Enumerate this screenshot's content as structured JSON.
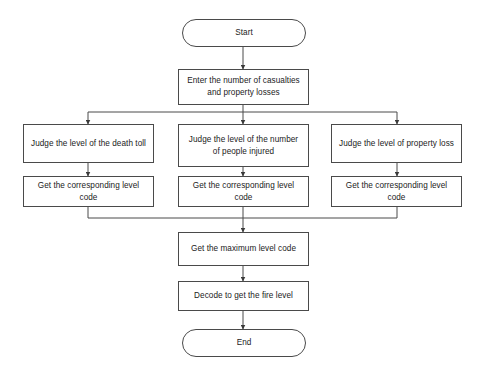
{
  "diagram": {
    "background_color": "#ffffff",
    "line_color": "#4a4a4a",
    "text_color": "#1b1b1b"
  },
  "nodes": {
    "start": {
      "label": "Start",
      "shape": "terminal"
    },
    "input": {
      "label": "Enter the number of casualties and property losses",
      "shape": "process"
    },
    "judge_death": {
      "label": "Judge the level of the death toll",
      "shape": "process"
    },
    "judge_injured": {
      "label": "Judge the level of the number of people injured",
      "shape": "process"
    },
    "judge_property": {
      "label": "Judge the level of property loss",
      "shape": "process"
    },
    "code_death": {
      "label": "Get the corresponding level code",
      "shape": "process"
    },
    "code_injured": {
      "label": "Get the corresponding level code",
      "shape": "process"
    },
    "code_property": {
      "label": "Get the corresponding level code",
      "shape": "process"
    },
    "max_code": {
      "label": "Get the maximum level code",
      "shape": "process"
    },
    "decode": {
      "label": "Decode to get the fire level",
      "shape": "process"
    },
    "end": {
      "label": "End",
      "shape": "terminal"
    }
  },
  "edges": [
    {
      "from": "start",
      "to": "input",
      "type": "straight"
    },
    {
      "from": "input",
      "to": "judge_death",
      "type": "split-left"
    },
    {
      "from": "input",
      "to": "judge_injured",
      "type": "straight"
    },
    {
      "from": "input",
      "to": "judge_property",
      "type": "split-right"
    },
    {
      "from": "judge_death",
      "to": "code_death",
      "type": "straight"
    },
    {
      "from": "judge_injured",
      "to": "code_injured",
      "type": "straight"
    },
    {
      "from": "judge_property",
      "to": "code_property",
      "type": "straight"
    },
    {
      "from": "code_death",
      "to": "max_code",
      "type": "merge-left"
    },
    {
      "from": "code_injured",
      "to": "max_code",
      "type": "straight"
    },
    {
      "from": "code_property",
      "to": "max_code",
      "type": "merge-right"
    },
    {
      "from": "max_code",
      "to": "decode",
      "type": "straight"
    },
    {
      "from": "decode",
      "to": "end",
      "type": "straight"
    }
  ]
}
